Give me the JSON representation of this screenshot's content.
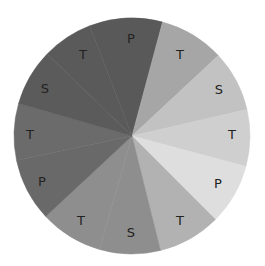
{
  "chart_data": {
    "type": "pie",
    "title": "",
    "legend": "none",
    "center": [
      132,
      136
    ],
    "radius": 118,
    "start_angle_deg": -21,
    "direction": "clockwise",
    "slices": [
      {
        "label": "P",
        "value": 36,
        "color": "#595959",
        "label_pos": [
          131,
          38
        ]
      },
      {
        "label": "T",
        "value": 32,
        "color": "#a6a6a6",
        "label_pos": [
          180,
          54
        ]
      },
      {
        "label": "S",
        "value": 30,
        "color": "#c2c2c2",
        "label_pos": [
          219,
          89
        ]
      },
      {
        "label": "T",
        "value": 28,
        "color": "#cfcfcf",
        "label_pos": [
          232,
          134
        ]
      },
      {
        "label": "P",
        "value": 30,
        "color": "#dedede",
        "label_pos": [
          218,
          183
        ]
      },
      {
        "label": "T",
        "value": 31,
        "color": "#b2b2b2",
        "label_pos": [
          180,
          220
        ]
      },
      {
        "label": "S",
        "value": 30,
        "color": "#8e8e8e",
        "label_pos": [
          131,
          232
        ]
      },
      {
        "label": "T",
        "value": 31,
        "color": "#8e8e8e",
        "label_pos": [
          81,
          220
        ]
      },
      {
        "label": "P",
        "value": 31,
        "color": "#696969",
        "label_pos": [
          42,
          181
        ]
      },
      {
        "label": "T",
        "value": 28,
        "color": "#6b6b6b",
        "label_pos": [
          30,
          134
        ]
      },
      {
        "label": "S",
        "value": 28,
        "color": "#5b5b5b",
        "label_pos": [
          45,
          88
        ]
      },
      {
        "label": "T",
        "value": 25,
        "color": "#5a5a5a",
        "label_pos": [
          83,
          54
        ]
      }
    ]
  }
}
